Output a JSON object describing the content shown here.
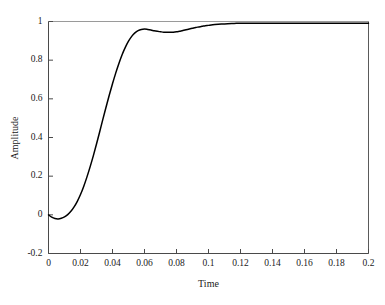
{
  "chart_data": {
    "type": "line",
    "title": "",
    "xlabel": "Time",
    "ylabel": "Amplitude",
    "xlim": [
      0,
      0.2
    ],
    "ylim": [
      -0.2,
      1
    ],
    "xticks": [
      0,
      0.02,
      0.04,
      0.06,
      0.08,
      0.1,
      0.12,
      0.14,
      0.16,
      0.18,
      0.2
    ],
    "xtick_labels": [
      "0",
      "0.02",
      "0.04",
      "0.06",
      "0.08",
      "0.1",
      "0.12",
      "0.14",
      "0.16",
      "0.18",
      "0.2"
    ],
    "yticks": [
      -0.2,
      0,
      0.2,
      0.4,
      0.6,
      0.8,
      1
    ],
    "ytick_labels": [
      "-0.2",
      "0",
      "0.2",
      "0.4",
      "0.6",
      "0.8",
      "1"
    ],
    "grid": false,
    "legend": null,
    "reference_lines": [
      {
        "name": "final-value-line",
        "orientation": "horizontal",
        "y": 1,
        "color": "#9a9a9a"
      },
      {
        "name": "right-border-line",
        "orientation": "vertical",
        "x": 0.2,
        "color": "#5a5a5a"
      }
    ],
    "series": [
      {
        "name": "step-response",
        "color": "#000000",
        "width": 1.5,
        "x": [
          0,
          0.002,
          0.004,
          0.006,
          0.008,
          0.01,
          0.012,
          0.014,
          0.016,
          0.018,
          0.02,
          0.022,
          0.024,
          0.026,
          0.028,
          0.03,
          0.032,
          0.034,
          0.036,
          0.038,
          0.04,
          0.042,
          0.044,
          0.046,
          0.048,
          0.05,
          0.052,
          0.054,
          0.056,
          0.058,
          0.06,
          0.062,
          0.064,
          0.066,
          0.068,
          0.07,
          0.072,
          0.074,
          0.076,
          0.078,
          0.08,
          0.082,
          0.084,
          0.086,
          0.088,
          0.09,
          0.092,
          0.094,
          0.096,
          0.098,
          0.1,
          0.104,
          0.108,
          0.112,
          0.116,
          0.12,
          0.124,
          0.128,
          0.132,
          0.14,
          0.15,
          0.16,
          0.17,
          0.18,
          0.19,
          0.2
        ],
        "y": [
          0,
          -0.012,
          -0.019,
          -0.021,
          -0.018,
          -0.011,
          0.001,
          0.018,
          0.041,
          0.07,
          0.105,
          0.147,
          0.195,
          0.248,
          0.305,
          0.366,
          0.43,
          0.495,
          0.558,
          0.62,
          0.678,
          0.733,
          0.783,
          0.828,
          0.866,
          0.898,
          0.923,
          0.941,
          0.953,
          0.959,
          0.961,
          0.959,
          0.956,
          0.952,
          0.949,
          0.947,
          0.945,
          0.944,
          0.944,
          0.945,
          0.947,
          0.95,
          0.953,
          0.957,
          0.961,
          0.965,
          0.969,
          0.972,
          0.975,
          0.978,
          0.98,
          0.984,
          0.987,
          0.989,
          0.99,
          0.991,
          0.991,
          0.991,
          0.991,
          0.991,
          0.991,
          0.991,
          0.991,
          0.991,
          0.991,
          0.991
        ]
      }
    ]
  }
}
